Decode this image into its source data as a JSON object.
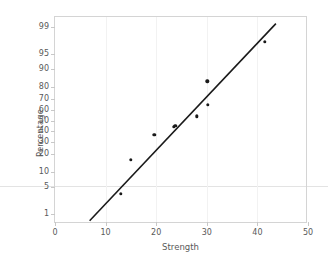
{
  "chart_data": {
    "type": "scatter",
    "title": "",
    "xlabel": "Strength",
    "ylabel": "Percentage",
    "xlim": [
      0,
      50
    ],
    "xticks": [
      0,
      10,
      20,
      30,
      40,
      50
    ],
    "xtick_labels": [
      "0",
      "10",
      "20",
      "30",
      "40",
      "50"
    ],
    "yscale": "normal-probability",
    "yticks": [
      1,
      5,
      10,
      20,
      30,
      40,
      50,
      60,
      70,
      80,
      90,
      95,
      99
    ],
    "ytick_labels": [
      "1",
      "5",
      "10",
      "20",
      "30",
      "40",
      "50",
      "60",
      "70",
      "80",
      "90",
      "95",
      "99"
    ],
    "ylim": [
      0.5,
      99.5
    ],
    "grid": "light-vertical-and-one-horizontal",
    "gridline_y_value": 5,
    "legend": "none",
    "point_color": "#1a1a1a",
    "line_color": "#1a1a1a",
    "axis_color": "#d4d4d4",
    "text_color": "#595959",
    "points": [
      {
        "x": 13.0,
        "y": 3.4
      },
      {
        "x": 15.0,
        "y": 16.5
      },
      {
        "x": 19.6,
        "y": 36.0
      },
      {
        "x": 23.5,
        "y": 43.5
      },
      {
        "x": 23.8,
        "y": 45.0
      },
      {
        "x": 28.0,
        "y": 54.0
      },
      {
        "x": 30.2,
        "y": 65.0
      },
      {
        "x": 30.1,
        "y": 83.5
      },
      {
        "x": 41.5,
        "y": 97.5
      }
    ],
    "fit_line": {
      "x_start": 6.9,
      "y_start": 0.55,
      "x_end": 44.0,
      "y_end": 99.2
    }
  }
}
